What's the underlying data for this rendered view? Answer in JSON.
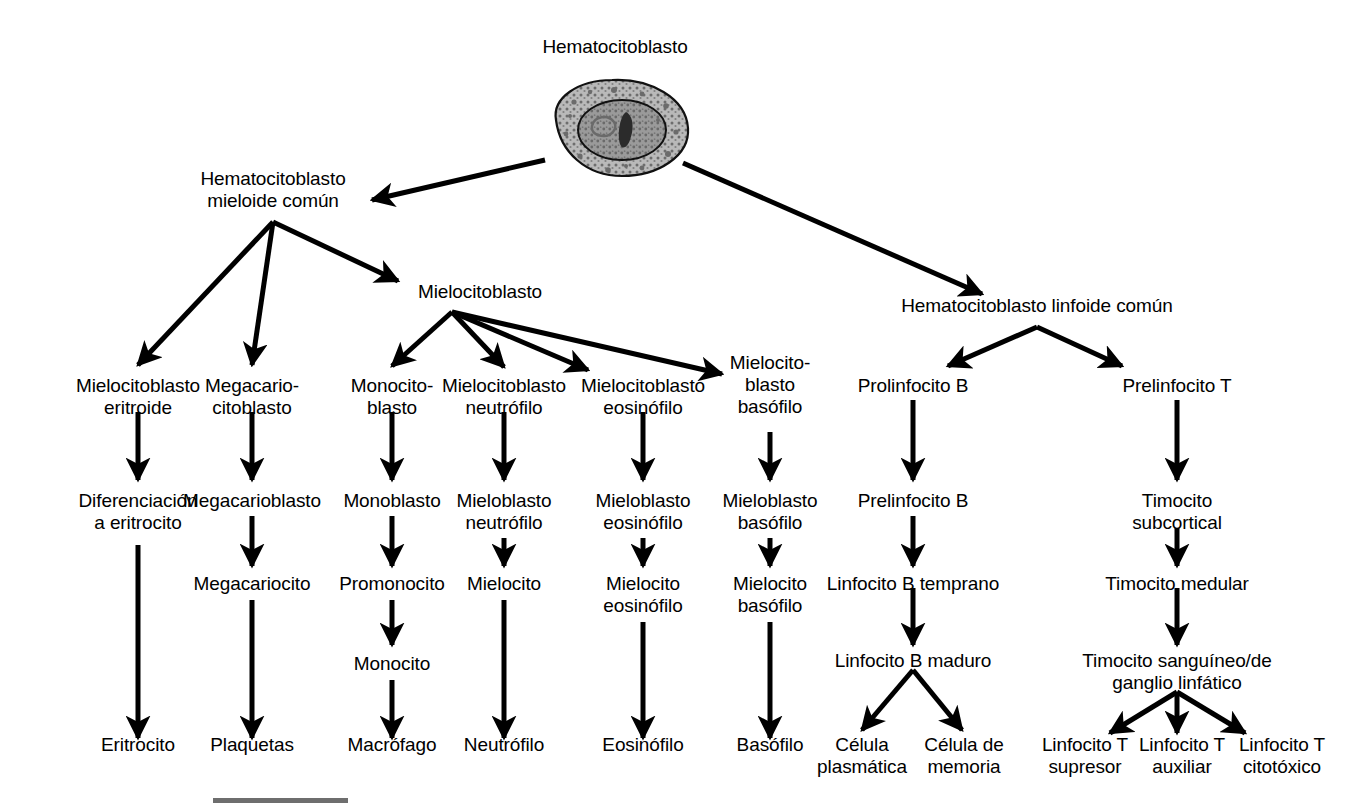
{
  "diagram": {
    "root": {
      "label": "Hematocitoblasto"
    },
    "lineages": {
      "myeloid_root": "Hematocitoblasto\nmieloide común",
      "myeloblast_root": "Mielocitoblasto",
      "lymphoid_root": "Hematocitoblasto linfoide común"
    },
    "columns": [
      {
        "id": "erythroid",
        "stages": [
          "Mielocitoblasto\neritroide",
          "Diferenciación\na eritrocito",
          "Eritrocito"
        ]
      },
      {
        "id": "megakaryocytic",
        "stages": [
          "Megacario-\ncitoblasto",
          "Megacarioblasto",
          "Megacariocito",
          "Plaquetas"
        ]
      },
      {
        "id": "monocytic",
        "stages": [
          "Monocito-\nblasto",
          "Monoblasto",
          "Promonocito",
          "Monocito",
          "Macrófago"
        ]
      },
      {
        "id": "neutrophil",
        "stages": [
          "Mielocitoblasto\nneutrófilo",
          "Mieloblasto\nneutrófilo",
          "Mielocito",
          "Neutrófilo"
        ]
      },
      {
        "id": "eosinophil",
        "stages": [
          "Mielocitoblasto\neosinófilo",
          "Mieloblasto\neosinófilo",
          "Mielocito\neosinófilo",
          "Eosinófilo"
        ]
      },
      {
        "id": "basophil",
        "stages": [
          "Mielocito-\nblasto\nbasófilo",
          "Mieloblasto\nbasófilo",
          "Mielocito\nbasófilo",
          "Basófilo"
        ]
      },
      {
        "id": "b-lymphocyte",
        "stages": [
          "Prolinfocito B",
          "Prelinfocito B",
          "Linfocito B temprano",
          "Linfocito B maduro"
        ],
        "terminals": [
          "Célula\nplasmática",
          "Célula de\nmemoria"
        ]
      },
      {
        "id": "t-lymphocyte",
        "stages": [
          "Prelinfocito T",
          "Timocito\nsubcortical",
          "Timocito medular",
          "Timocito sanguíneo/de\nganglio linfático"
        ],
        "terminals": [
          "Linfocito T\nsupresor",
          "Linfocito T\nauxiliar",
          "Linfocito T\ncitotóxico"
        ]
      }
    ],
    "colors": {
      "stroke": "#000000",
      "background": "#ffffff",
      "cell_cytoplasm": "#b4b4b4",
      "cell_nucleus": "#8f8f8f",
      "footer_bar": "#6e6e6e"
    }
  }
}
